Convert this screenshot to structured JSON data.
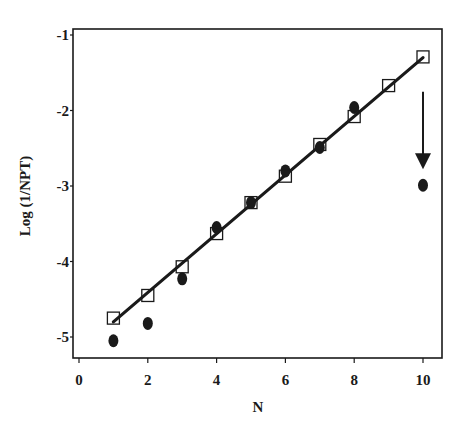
{
  "chart_data": {
    "type": "scatter",
    "title": "",
    "xlabel": "N",
    "ylabel": "Log (1/NPT)",
    "xlim": [
      -0.2,
      10.6
    ],
    "ylim": [
      -5.3,
      -0.92
    ],
    "xticks": [
      0,
      2,
      4,
      6,
      8,
      10
    ],
    "yticks": [
      -1,
      -2,
      -3,
      -4,
      -5
    ],
    "grid": false,
    "legend": null,
    "series": [
      {
        "name": "open squares",
        "marker": "square-open",
        "x": [
          1,
          2,
          3,
          4,
          5,
          6,
          7,
          8,
          9,
          10
        ],
        "y": [
          -4.75,
          -4.45,
          -4.07,
          -3.63,
          -3.22,
          -2.87,
          -2.45,
          -2.08,
          -1.67,
          -1.29
        ]
      },
      {
        "name": "filled circles",
        "marker": "circle-filled",
        "x": [
          1,
          2,
          3,
          4,
          5,
          6,
          7,
          8,
          10
        ],
        "y": [
          -5.05,
          -4.82,
          -4.23,
          -3.55,
          -3.22,
          -2.8,
          -2.49,
          -1.96,
          -2.99
        ]
      },
      {
        "name": "linear fit",
        "type": "line",
        "x": [
          1,
          10
        ],
        "y": [
          -4.8,
          -1.3
        ]
      }
    ],
    "annotations": [
      {
        "type": "arrow",
        "direction": "down",
        "x": 10,
        "y_from": -1.75,
        "y_to": -2.75,
        "points_to": "filled circle at N=10"
      }
    ],
    "colors": {
      "ink": "#1a1a1a",
      "background": "#ffffff"
    }
  }
}
